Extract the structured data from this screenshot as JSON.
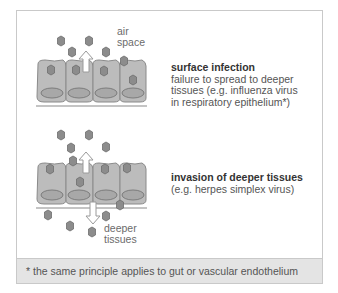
{
  "panels": [
    {
      "id": "surface",
      "title": "surface infection",
      "description_lines": [
        "failure to spread to deeper",
        "tissues (e.g. influenza virus",
        "in respiratory epithelium*)"
      ],
      "labels": {
        "top": [
          "air",
          "space"
        ]
      }
    },
    {
      "id": "invasion",
      "title": "invasion of deeper tissues",
      "description_lines": [
        "(e.g. herpes simplex virus)"
      ],
      "labels": {
        "bottom": [
          "deeper",
          "tissues"
        ]
      }
    }
  ],
  "footnote": "* the same principle applies to gut or vascular endothelium",
  "colors": {
    "cell_fill": "#bcbcbc",
    "cell_stroke": "#8a8a8a",
    "nucleus_fill": "#a8a8a8",
    "virus_fill": "#8c8c8c",
    "virus_stroke": "#6e6e6e",
    "arrow_fill": "#ffffff",
    "arrow_stroke": "#9a9a9a",
    "footer_bg": "#e4e4e4",
    "border": "#c9c9c9"
  }
}
